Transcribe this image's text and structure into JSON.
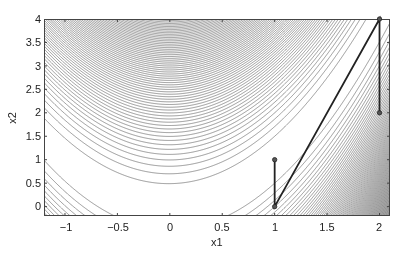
{
  "chart_data": {
    "type": "contour",
    "title": "",
    "xlabel": "x1",
    "ylabel": "x2",
    "xlim": [
      -1.2,
      2.1
    ],
    "ylim": [
      -0.2,
      4.0
    ],
    "grid": false,
    "legend": null,
    "function": "100*(x2 - x1^2)^2 + (1 - x1)^2",
    "contour_levels": {
      "start": 25,
      "step": 25,
      "count": 120
    },
    "xticks": [
      -1,
      -0.5,
      0,
      0.5,
      1,
      1.5,
      2
    ],
    "xtick_labels": [
      "−1",
      "−0.5",
      "0",
      "0.5",
      "1",
      "1.5",
      "2"
    ],
    "yticks": [
      0,
      0.5,
      1,
      1.5,
      2,
      2.5,
      3,
      3.5,
      4
    ],
    "ytick_labels": [
      "0",
      "0.5",
      "1",
      "1.5",
      "2",
      "2.5",
      "3",
      "3.5",
      "4"
    ],
    "path": {
      "points": [
        [
          1,
          1
        ],
        [
          1,
          0
        ],
        [
          2,
          4
        ],
        [
          2,
          2
        ]
      ],
      "color": "#222222",
      "line_width": 1.8,
      "marker": "circle"
    },
    "contour_color": "#555555"
  }
}
